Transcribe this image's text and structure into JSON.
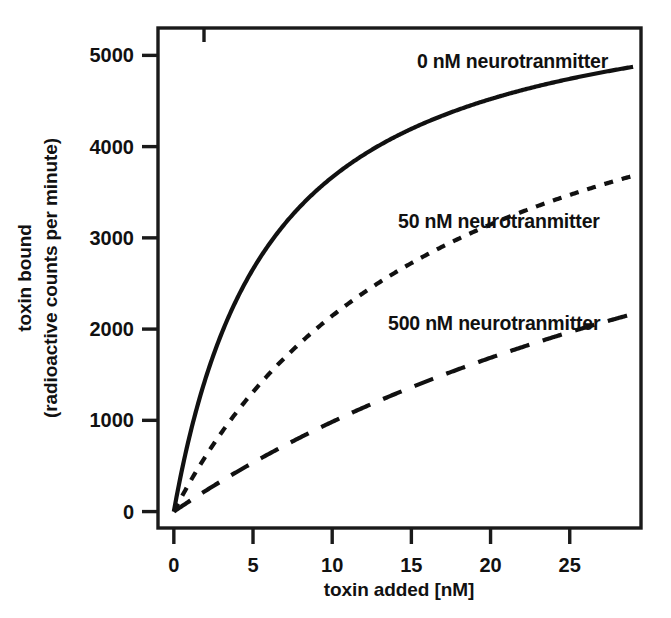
{
  "chart_data": {
    "type": "line",
    "title": "",
    "subtitle": "",
    "xlabel": "toxin added [nM]",
    "ylabel_line1": "toxin bound",
    "ylabel_line2": "(radioactive counts per minute)",
    "xlim": [
      -1,
      29.5
    ],
    "ylim": [
      -180,
      5300
    ],
    "grid": false,
    "legend_position": "inline-annotations",
    "xticks": [
      0,
      5,
      10,
      15,
      20,
      25
    ],
    "xtick_labels": [
      "0",
      "5",
      "10",
      "15",
      "20",
      "25"
    ],
    "yticks": [
      0,
      1000,
      2000,
      3000,
      4000,
      5000
    ],
    "ytick_labels": [
      "0",
      "1000",
      "2000",
      "3000",
      "4000",
      "5000"
    ],
    "series": [
      {
        "name": "0 nM neurotranmitter",
        "label": "0 nM neurotranmitter",
        "style": "solid",
        "bmax": 5900,
        "kd": 6.1,
        "x": [
          0,
          1,
          2,
          3,
          4,
          5,
          6,
          7,
          8,
          9,
          10,
          11,
          12,
          13,
          14,
          15,
          16,
          17,
          18,
          19,
          20,
          21,
          22,
          23,
          24,
          25,
          26,
          27,
          28,
          29
        ],
        "values": [
          0,
          831,
          1460,
          1949,
          2339,
          2658,
          2922,
          3146,
          3338,
          3504,
          3650,
          3779,
          3894,
          3997,
          4090,
          4175,
          4252,
          4322,
          4387,
          4447,
          4502,
          4553,
          4601,
          4645,
          4687,
          4726,
          4762,
          4796,
          4828,
          4859
        ]
      },
      {
        "name": "50 nM neurotranmitter",
        "label": "50 nM neurotranmitter",
        "style": "short-dash",
        "bmax": 5900,
        "kd": 17.5,
        "x": [
          0,
          1,
          2,
          3,
          4,
          5,
          6,
          7,
          8,
          9,
          10,
          11,
          12,
          13,
          14,
          15,
          16,
          17,
          18,
          19,
          20,
          21,
          22,
          23,
          24,
          25,
          26,
          27,
          28,
          29
        ],
        "values": [
          0,
          319,
          604,
          861,
          1093,
          1304,
          1496,
          1672,
          1834,
          1983,
          2120,
          2248,
          2366,
          2476,
          2578,
          2674,
          2764,
          2848,
          2927,
          3002,
          3072,
          3139,
          3202,
          3262,
          3318,
          3372,
          3424,
          3473,
          3520,
          3564
        ]
      },
      {
        "name": "500 nM neurotranmitter",
        "label": "500 nM neurotranmitter",
        "style": "long-dash",
        "bmax": 5900,
        "kd": 50.0,
        "x": [
          0,
          1,
          2,
          3,
          4,
          5,
          6,
          7,
          8,
          9,
          10,
          11,
          12,
          13,
          14,
          15,
          16,
          17,
          18,
          19,
          20,
          21,
          22,
          23,
          24,
          25,
          26,
          27,
          28,
          29
        ],
        "values": [
          0,
          116,
          227,
          334,
          437,
          536,
          632,
          724,
          814,
          900,
          983,
          1064,
          1142,
          1218,
          1291,
          1362,
          1431,
          1498,
          1563,
          1626,
          1687,
          1747,
          1805,
          1861,
          1916,
          1970,
          2022,
          2073,
          2122,
          2171
        ]
      }
    ],
    "annotations": [
      {
        "text": "0 nM neurotranmitter",
        "x_px": 417,
        "y_px": 68
      },
      {
        "text": "50 nM neurotranmitter",
        "x_px": 398,
        "y_px": 228
      },
      {
        "text": "500 nM neurotranmitter",
        "x_px": 388,
        "y_px": 330
      }
    ],
    "colors": {
      "line": "#111111",
      "axis": "#1a1a1a",
      "background": "#ffffff"
    }
  }
}
